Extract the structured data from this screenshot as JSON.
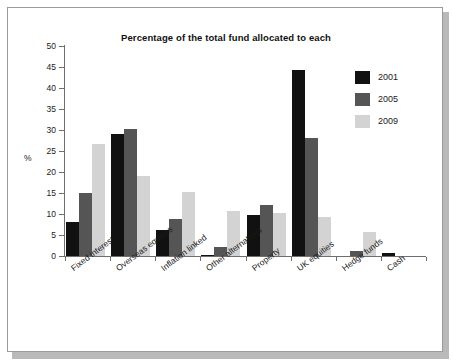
{
  "chart_data": {
    "type": "bar",
    "title": "Percentage of the total fund allocated to each",
    "xlabel": "",
    "ylabel": "%",
    "ylim": [
      0,
      50
    ],
    "yticks": [
      0,
      5,
      10,
      15,
      20,
      25,
      30,
      35,
      40,
      45,
      50
    ],
    "grid": false,
    "legend_position": "top-right",
    "categories": [
      "Fixed interest",
      "Overseas equities",
      "Inflation linked",
      "Other alternatives",
      "Property",
      "UK equities",
      "Hedge funds",
      "Cash"
    ],
    "series": [
      {
        "name": "2001",
        "color": "#111111",
        "values": [
          8.1,
          29.0,
          6.3,
          0.2,
          9.8,
          44.3,
          0.0,
          0.8
        ]
      },
      {
        "name": "2005",
        "color": "#555555",
        "values": [
          15.0,
          30.2,
          8.8,
          2.1,
          12.2,
          28.1,
          1.3,
          0.0
        ]
      },
      {
        "name": "2009",
        "color": "#d3d3d3",
        "values": [
          26.6,
          19.0,
          15.3,
          10.8,
          10.2,
          9.4,
          5.7,
          0.0
        ]
      }
    ]
  }
}
